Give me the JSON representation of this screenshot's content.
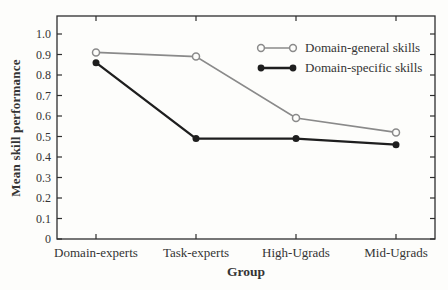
{
  "figure": {
    "background": "#fdfdfb",
    "text_color": "#343434",
    "axis_color": "#2e2e2e"
  },
  "chart_data": {
    "type": "line",
    "title": "",
    "xlabel": "Group",
    "ylabel": "Mean skill performance",
    "categories": [
      "Domain-experts",
      "Task-experts",
      "High-Ugrads",
      "Mid-Ugrads"
    ],
    "series": [
      {
        "name": "Domain-general skills",
        "values": [
          0.91,
          0.89,
          0.59,
          0.52
        ],
        "color": "#8a8a8a",
        "marker": "open-circle",
        "line_width": 1.7
      },
      {
        "name": "Domain-specific skills",
        "values": [
          0.86,
          0.49,
          0.49,
          0.46
        ],
        "color": "#1e1e1e",
        "marker": "filled-circle",
        "line_width": 2.3
      }
    ],
    "ylim": [
      0,
      1.0
    ],
    "yticks": [
      0,
      0.1,
      0.2,
      0.3,
      0.4,
      0.5,
      0.6,
      0.7,
      0.8,
      0.9,
      1.0
    ],
    "ytick_labels": [
      "0",
      "0.1",
      "0.2",
      "0.3",
      "0.4",
      "0.5",
      "0.6",
      "0.7",
      "0.8",
      "0.9",
      "1.0"
    ],
    "grid": false,
    "legend_position": "inside-top-right",
    "frame": "box-with-inward-ticks"
  }
}
